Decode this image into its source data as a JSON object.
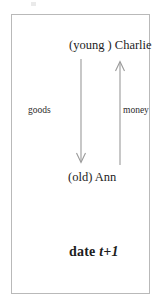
{
  "figure": {
    "type": "economic-flow-diagram",
    "frame": {
      "caption": "date t+1",
      "caption_prefix": "date ",
      "caption_math": "t+1"
    },
    "agents": {
      "top": "(young ) Charlie",
      "bottom": "(old) Ann"
    },
    "flows": [
      {
        "name": "goods",
        "label": "goods",
        "direction": "down",
        "from": "(young ) Charlie",
        "to": "(old) Ann"
      },
      {
        "name": "money",
        "label": "money",
        "direction": "up",
        "from": "(old) Ann",
        "to": "(young ) Charlie"
      }
    ],
    "colors": {
      "ink": "#1d1d1d",
      "arrow": "#9a9a9a",
      "frame": "#b9b9b9",
      "background": "#ffffff"
    }
  }
}
